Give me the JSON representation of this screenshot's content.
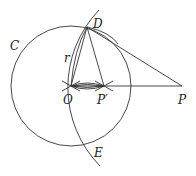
{
  "diagram": {
    "points": {
      "O": {
        "label": "O",
        "x": 71,
        "y": 86
      },
      "D": {
        "label": "D",
        "x": 87,
        "y": 27
      },
      "E": {
        "label": "E",
        "x": 87,
        "y": 145
      },
      "P_prime": {
        "label": "P′",
        "x": 104,
        "y": 86
      },
      "P": {
        "label": "P",
        "x": 182,
        "y": 86
      }
    },
    "circle_label": "C",
    "radius_label": "r",
    "stroke_color": "#333333",
    "background": "#ffffff"
  }
}
